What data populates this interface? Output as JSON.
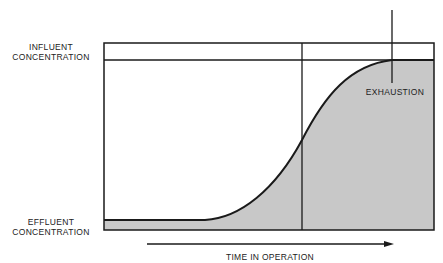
{
  "diagram": {
    "labels": {
      "influent_line1": "INFLUENT",
      "influent_line2": "CONCENTRATION",
      "effluent_line1": "EFFLUENT",
      "effluent_line2": "CONCENTRATION",
      "exhaustion": "EXHAUSTION",
      "x_axis": "TIME IN OPERATION"
    },
    "colors": {
      "line": "#1a1a1a",
      "fill": "#c8c8c8",
      "background": "#ffffff"
    }
  }
}
